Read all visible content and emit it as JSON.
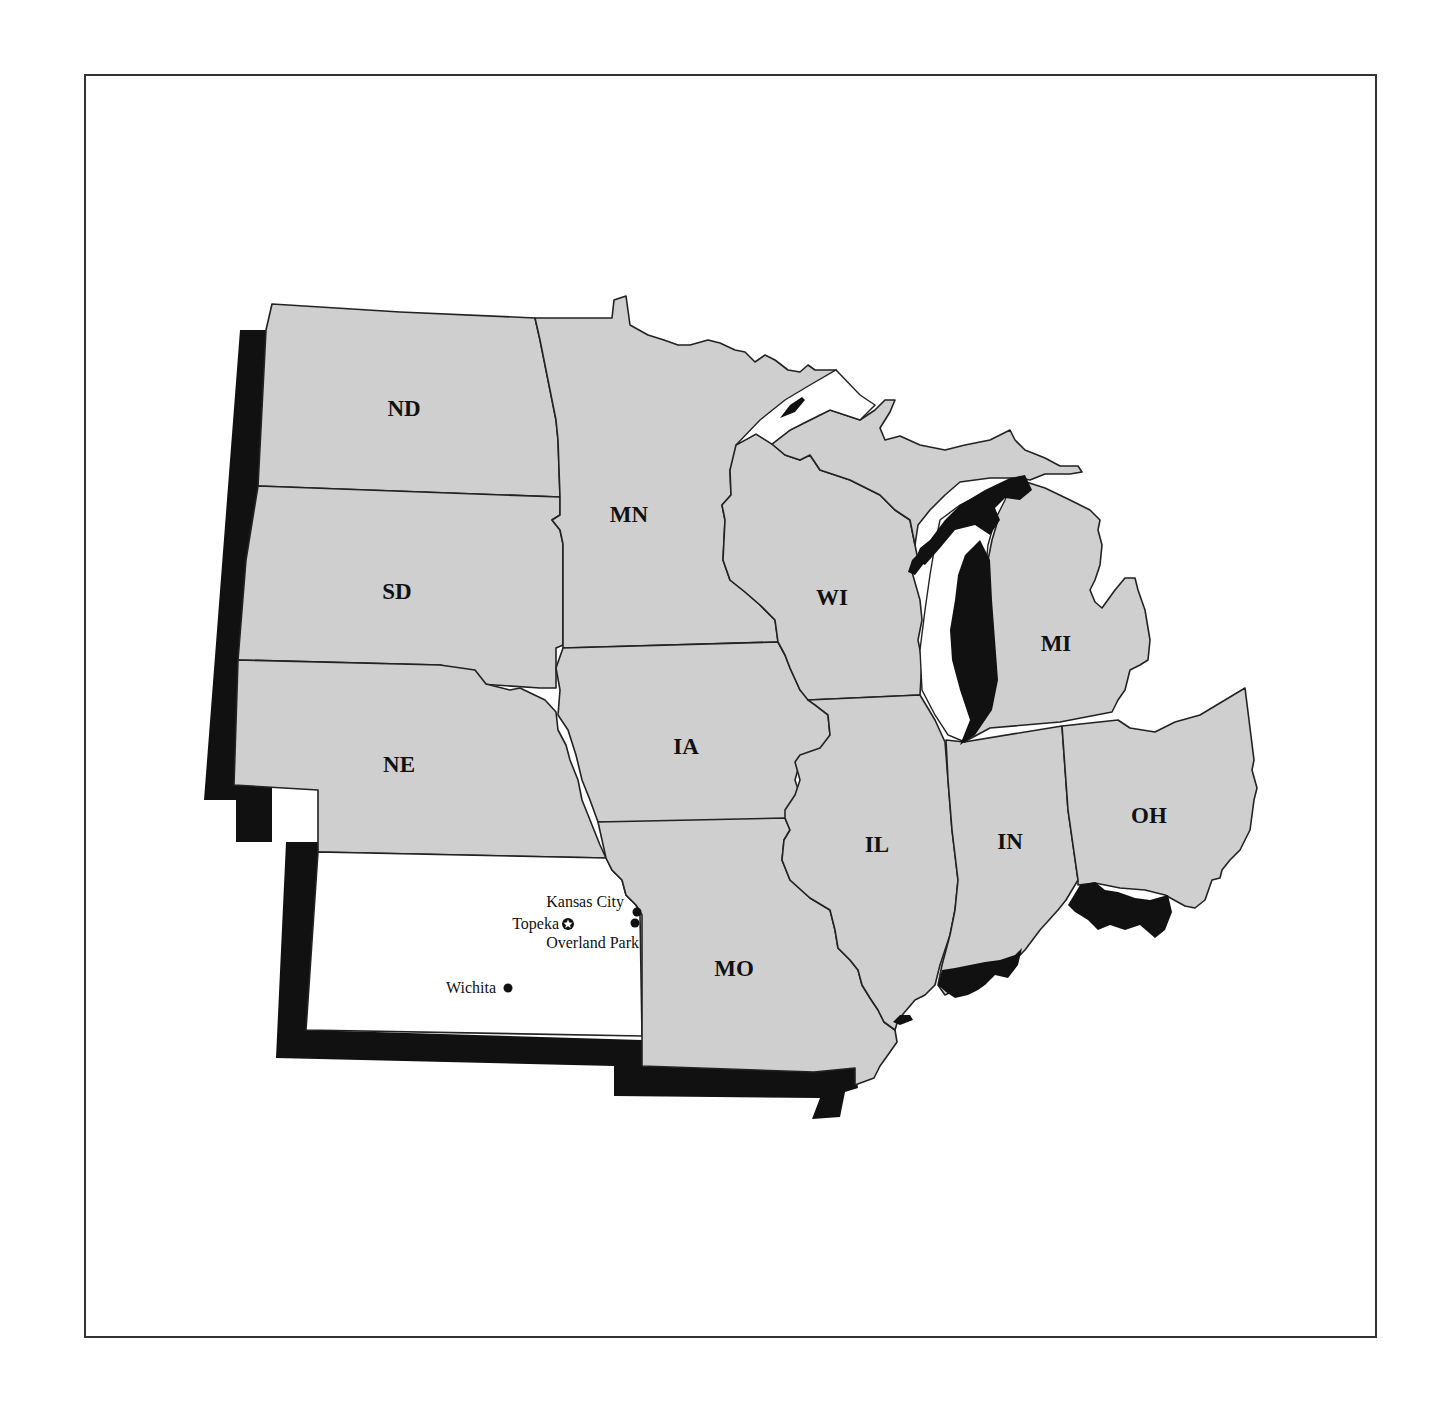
{
  "map": {
    "region": "Midwest United States",
    "highlighted_state": "KS",
    "colors": {
      "state_fill": "#cfcfcf",
      "highlight_fill": "#ffffff",
      "shadow": "#111111",
      "border": "#222222"
    },
    "states": [
      {
        "abbr": "ND",
        "label": "ND"
      },
      {
        "abbr": "SD",
        "label": "SD"
      },
      {
        "abbr": "NE",
        "label": "NE"
      },
      {
        "abbr": "MN",
        "label": "MN"
      },
      {
        "abbr": "IA",
        "label": "IA"
      },
      {
        "abbr": "MO",
        "label": "MO"
      },
      {
        "abbr": "WI",
        "label": "WI"
      },
      {
        "abbr": "IL",
        "label": "IL"
      },
      {
        "abbr": "MI",
        "label": "MI"
      },
      {
        "abbr": "IN",
        "label": "IN"
      },
      {
        "abbr": "OH",
        "label": "OH"
      }
    ],
    "cities": [
      {
        "name": "Kansas City",
        "marker": "dot"
      },
      {
        "name": "Topeka",
        "marker": "capital-star"
      },
      {
        "name": "Overland Park",
        "marker": "dot"
      },
      {
        "name": "Wichita",
        "marker": "dot"
      }
    ]
  }
}
